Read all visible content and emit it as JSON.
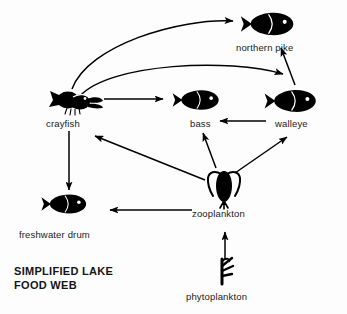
{
  "title": {
    "line1": "SIMPLIFIED LAKE",
    "line2": "FOOD WEB"
  },
  "colors": {
    "ink": "#000000",
    "background": "#fdfdfd",
    "label_text": "#1b1b1b"
  },
  "nodes": [
    {
      "id": "northern_pike",
      "label": "northern pike",
      "icon": "fish-icon",
      "label_x": 236,
      "label_y": 42
    },
    {
      "id": "crayfish",
      "label": "crayfish",
      "icon": "crayfish-icon",
      "label_x": 46,
      "label_y": 118
    },
    {
      "id": "bass",
      "label": "bass",
      "icon": "fish-icon",
      "label_x": 190,
      "label_y": 118
    },
    {
      "id": "walleye",
      "label": "walleye",
      "icon": "fish-icon",
      "label_x": 275,
      "label_y": 118
    },
    {
      "id": "zooplankton",
      "label": "zooplankton",
      "icon": "zooplankton-icon",
      "label_x": 192,
      "label_y": 208
    },
    {
      "id": "freshwater_drum",
      "label": "freshwater drum",
      "icon": "fish-icon",
      "label_x": 19,
      "label_y": 229
    },
    {
      "id": "phytoplankton",
      "label": "phytoplankton",
      "icon": "phytoplankton-icon",
      "label_x": 186,
      "label_y": 291
    }
  ],
  "links": [
    {
      "from": "crayfish",
      "to": "northern_pike",
      "style": "curved"
    },
    {
      "from": "crayfish",
      "to": "walleye",
      "style": "curved"
    },
    {
      "from": "crayfish",
      "to": "bass",
      "style": "straight"
    },
    {
      "from": "walleye",
      "to": "northern_pike",
      "style": "straight"
    },
    {
      "from": "walleye",
      "to": "bass",
      "style": "straight"
    },
    {
      "from": "crayfish",
      "to": "freshwater_drum",
      "style": "straight"
    },
    {
      "from": "zooplankton",
      "to": "crayfish",
      "style": "straight"
    },
    {
      "from": "zooplankton",
      "to": "bass",
      "style": "straight"
    },
    {
      "from": "zooplankton",
      "to": "walleye",
      "style": "straight"
    },
    {
      "from": "zooplankton",
      "to": "freshwater_drum",
      "style": "straight"
    },
    {
      "from": "phytoplankton",
      "to": "zooplankton",
      "style": "straight"
    }
  ]
}
